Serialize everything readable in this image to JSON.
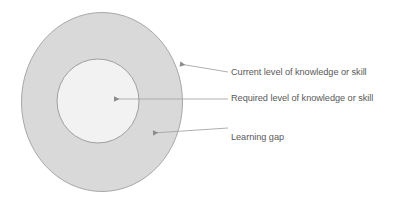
{
  "diagram": {
    "type": "concentric-circles",
    "shapes": {
      "outer_ellipse": {
        "name": "Current level of knowledge or skill",
        "fill": "#d9d9d9",
        "stroke": "#a6a6a6",
        "cx": 102,
        "cy": 102,
        "rx": 80,
        "ry": 90
      },
      "inner_circle": {
        "name": "Required level of knowledge or skill",
        "fill": "#f2f2f2",
        "stroke": "#a6a6a6",
        "cx": 98,
        "cy": 101,
        "rx": 41,
        "ry": 42
      },
      "ring": {
        "name": "Learning gap",
        "fill": "#d9d9d9"
      }
    },
    "leader_line_color": "#a6a6a6",
    "text_color": "#595959",
    "background": "#ffffff"
  },
  "callouts": [
    {
      "id": "current",
      "label": "Current level of knowledge or skill",
      "target": "outer-ellipse-edge",
      "arrow_x": 177,
      "arrow_y": 63
    },
    {
      "id": "required",
      "label": "Required level of knowledge or skill",
      "target": "inner-circle-center",
      "arrow_x": 111,
      "arrow_y": 99
    },
    {
      "id": "gap",
      "label": "Learning gap",
      "target": "ring-band",
      "arrow_x": 150,
      "arrow_y": 133
    }
  ]
}
